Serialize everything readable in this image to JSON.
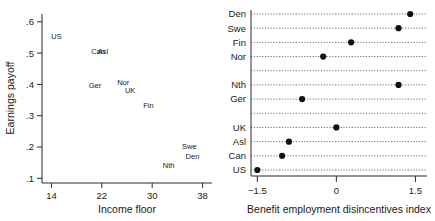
{
  "figure": {
    "panels": [
      "left-scatter",
      "right-dotplot"
    ]
  },
  "chart_data": [
    {
      "type": "scatter",
      "panel": "left",
      "title": "",
      "xlabel": "Income floor",
      "ylabel": "Earnings payoff",
      "xlim": [
        12.5,
        39.5
      ],
      "ylim": [
        0.085,
        0.625
      ],
      "xticks": [
        14,
        22,
        30,
        38
      ],
      "xticklabels": [
        "14",
        "22",
        "30",
        "38"
      ],
      "yticks": [
        0.1,
        0.2,
        0.3,
        0.4,
        0.5,
        0.6
      ],
      "yticklabels": [
        ".1",
        ".2",
        ".3",
        ".4",
        ".5",
        ".6"
      ],
      "grid": false,
      "marker": "text-label-only",
      "points": [
        {
          "label": "US",
          "x": 14.8,
          "y": 0.545
        },
        {
          "label": "Can",
          "x": 21.4,
          "y": 0.497
        },
        {
          "label": "Asl",
          "x": 22.2,
          "y": 0.497
        },
        {
          "label": "Ger",
          "x": 20.9,
          "y": 0.388
        },
        {
          "label": "Nor",
          "x": 25.4,
          "y": 0.398
        },
        {
          "label": "UK",
          "x": 26.5,
          "y": 0.374
        },
        {
          "label": "Fin",
          "x": 29.4,
          "y": 0.326
        },
        {
          "label": "Swe",
          "x": 35.9,
          "y": 0.195
        },
        {
          "label": "Den",
          "x": 36.4,
          "y": 0.163
        },
        {
          "label": "Nth",
          "x": 32.6,
          "y": 0.134
        }
      ]
    },
    {
      "type": "scatter",
      "panel": "right",
      "orientation": "horizontal",
      "title": "",
      "xlabel": "Benefit employment disincentives index",
      "ylabel": "",
      "xlim": [
        -1.62,
        1.72
      ],
      "xticks": [
        -1.5,
        0,
        1.5
      ],
      "xticklabels": [
        "−1.5",
        "0",
        "1.5"
      ],
      "grid": true,
      "gridstyle": "dotted-horizontal",
      "categories": [
        "Den",
        "Swe",
        "Fin",
        "Nor",
        "",
        "Nth",
        "Ger",
        "",
        "UK",
        "Asl",
        "Can",
        "US"
      ],
      "values": [
        1.4,
        1.18,
        0.28,
        -0.25,
        null,
        1.18,
        -0.65,
        null,
        0.0,
        -0.9,
        -1.03,
        -1.5
      ],
      "rows": [
        {
          "label": "Den",
          "value": 1.4,
          "spacer": false
        },
        {
          "label": "Swe",
          "value": 1.18,
          "spacer": false
        },
        {
          "label": "Fin",
          "value": 0.28,
          "spacer": false
        },
        {
          "label": "Nor",
          "value": -0.25,
          "spacer": false
        },
        {
          "label": "",
          "value": null,
          "spacer": true
        },
        {
          "label": "Nth",
          "value": 1.18,
          "spacer": false
        },
        {
          "label": "Ger",
          "value": -0.65,
          "spacer": false
        },
        {
          "label": "",
          "value": null,
          "spacer": true
        },
        {
          "label": "UK",
          "value": 0.0,
          "spacer": false
        },
        {
          "label": "Asl",
          "value": -0.9,
          "spacer": false
        },
        {
          "label": "Can",
          "value": -1.03,
          "spacer": false
        },
        {
          "label": "US",
          "value": -1.5,
          "spacer": false
        }
      ]
    }
  ],
  "colors": {
    "axis": "#2b2b2b",
    "marker": "#111111",
    "grid": "#4a4a4a",
    "text": "#1a1a1a",
    "background": "#ffffff"
  }
}
